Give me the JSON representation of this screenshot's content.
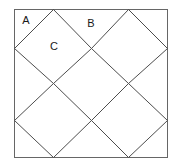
{
  "figure": {
    "type": "geometry-diagram",
    "background_color": "#ffffff",
    "stroke_color": "#4d4d4d",
    "outline_color": "#666666",
    "label_color": "#1a1a1a",
    "stroke_width": 1,
    "outline_width": 1,
    "canvas": {
      "width": 180,
      "height": 166
    },
    "square": {
      "left": 14,
      "top": 9,
      "right": 167,
      "bottom": 157,
      "width": 153,
      "height": 148
    },
    "edge_vertices": {
      "top": [
        53,
        128
      ],
      "bottom": [
        53,
        128
      ],
      "left": [
        48,
        120
      ],
      "right": [
        48,
        120
      ]
    },
    "labels": [
      {
        "text": "A",
        "x": 26,
        "y": 21
      },
      {
        "text": "B",
        "x": 91,
        "y": 24
      },
      {
        "text": "C",
        "x": 54,
        "y": 47
      }
    ],
    "lines": [
      {
        "id": "l1",
        "x1": 14,
        "y1": 48,
        "x2": 53,
        "y2": 9
      },
      {
        "id": "l2",
        "x1": 53,
        "y1": 9,
        "x2": 91,
        "y2": 48
      },
      {
        "id": "l3",
        "x1": 91,
        "y1": 48,
        "x2": 128,
        "y2": 9
      },
      {
        "id": "l4",
        "x1": 128,
        "y1": 9,
        "x2": 167,
        "y2": 48
      },
      {
        "id": "l5",
        "x1": 14,
        "y1": 48,
        "x2": 53,
        "y2": 83
      },
      {
        "id": "l6",
        "x1": 53,
        "y1": 83,
        "x2": 91,
        "y2": 48
      },
      {
        "id": "l7",
        "x1": 91,
        "y1": 48,
        "x2": 128,
        "y2": 83
      },
      {
        "id": "l8",
        "x1": 128,
        "y1": 83,
        "x2": 167,
        "y2": 48
      },
      {
        "id": "l9",
        "x1": 14,
        "y1": 120,
        "x2": 53,
        "y2": 83
      },
      {
        "id": "l10",
        "x1": 53,
        "y1": 83,
        "x2": 91,
        "y2": 120
      },
      {
        "id": "l11",
        "x1": 91,
        "y1": 120,
        "x2": 128,
        "y2": 83
      },
      {
        "id": "l12",
        "x1": 128,
        "y1": 83,
        "x2": 167,
        "y2": 120
      },
      {
        "id": "l13",
        "x1": 14,
        "y1": 120,
        "x2": 53,
        "y2": 157
      },
      {
        "id": "l14",
        "x1": 53,
        "y1": 157,
        "x2": 91,
        "y2": 120
      },
      {
        "id": "l15",
        "x1": 91,
        "y1": 120,
        "x2": 128,
        "y2": 157
      },
      {
        "id": "l16",
        "x1": 128,
        "y1": 157,
        "x2": 167,
        "y2": 120
      }
    ]
  }
}
